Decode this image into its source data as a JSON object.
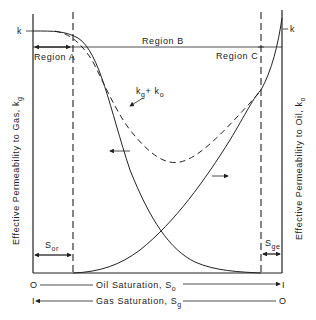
{
  "diagram": {
    "left_axis_label": "Effective Permeability to Gas, k",
    "left_axis_sub": "g",
    "right_axis_label": "Effective Permeability to Oil, k",
    "right_axis_sub": "o",
    "top_left_k": "k",
    "top_right_k": "k",
    "regions": {
      "a": "Region A",
      "b": "Region B",
      "c": "Region C"
    },
    "sum_curve_label": "k",
    "sum_curve_sub1": "g",
    "sum_curve_plus": "+ k",
    "sum_curve_sub2": "o",
    "sor_label": "S",
    "sor_sub": "or",
    "sge_label": "S",
    "sge_sub": "ge",
    "x_axis_oil": {
      "left": "O",
      "label": "Oil Saturation, S",
      "sub": "o",
      "right": "I"
    },
    "x_axis_gas": {
      "left": "I",
      "label": "Gas Saturation, S",
      "sub": "g",
      "right": "O"
    }
  }
}
